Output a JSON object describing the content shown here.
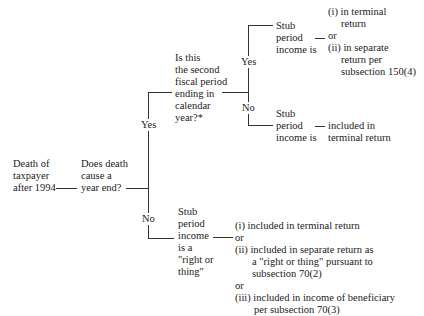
{
  "root": {
    "node1": [
      "Death of",
      "taxpayer",
      "after 1994"
    ],
    "node2": [
      "Does death",
      "cause a",
      "year end?"
    ]
  },
  "branch_labels": {
    "yes_main": "Yes",
    "no_main": "No",
    "yes_sub": "Yes",
    "no_sub": "No"
  },
  "yes_branch": {
    "question": [
      "Is this",
      "the second",
      "fiscal period",
      "ending in",
      "calendar",
      "year?*"
    ],
    "yes_outcome": {
      "label": [
        "Stub",
        "period",
        "income is"
      ],
      "connector": "—",
      "options": [
        {
          "text": "(i) in terminal",
          "cont": "return"
        },
        {
          "text": "or"
        },
        {
          "text": "(ii) in separate",
          "cont": "return per",
          "cont2": "subsection 150(4)"
        }
      ]
    },
    "no_outcome": {
      "label": [
        "Stub",
        "period",
        "income is"
      ],
      "connector": "—",
      "result": [
        "included in",
        "terminal return"
      ]
    }
  },
  "no_branch": {
    "label": [
      "Stub",
      "period",
      "income",
      "is a",
      "\"right or",
      "thing\""
    ],
    "options": [
      "(i) included in terminal return",
      "or",
      "(ii) included in separate return as",
      "a \"right or thing\" pursuant to",
      "subsection 70(2)",
      "or",
      "(iii) included in income of beneficiary",
      "per subsection 70(3)"
    ]
  }
}
